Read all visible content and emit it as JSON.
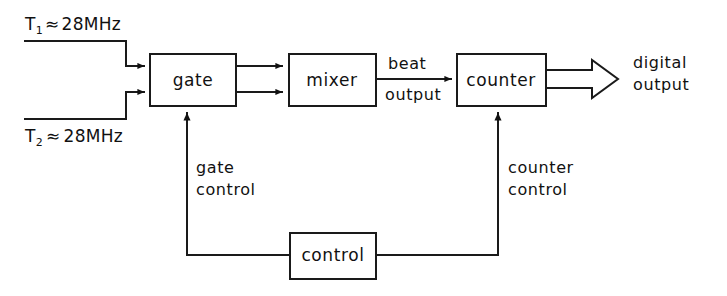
{
  "diagram": {
    "colors": {
      "ink": "#1a1a1a",
      "background": "#ffffff"
    },
    "blocks": [
      {
        "id": "gate",
        "label": "gate"
      },
      {
        "id": "mixer",
        "label": "mixer"
      },
      {
        "id": "counter",
        "label": "counter"
      },
      {
        "id": "control",
        "label": "control"
      }
    ],
    "inputs": [
      {
        "id": "t1",
        "name": "T",
        "subscript": "1",
        "relation": "≈",
        "value": "28MHz",
        "text": "T1 ≈ 28MHz"
      },
      {
        "id": "t2",
        "name": "T",
        "subscript": "2",
        "relation": "≈",
        "value": "28MHz",
        "text": "T2 ≈ 28MHz"
      }
    ],
    "wire_labels": [
      {
        "id": "beat-output",
        "line1": "beat",
        "line2": "output"
      },
      {
        "id": "digital-output",
        "line1": "digital",
        "line2": "output"
      },
      {
        "id": "gate-control",
        "line1": "gate",
        "line2": "control"
      },
      {
        "id": "counter-control",
        "line1": "counter",
        "line2": "control"
      }
    ]
  }
}
